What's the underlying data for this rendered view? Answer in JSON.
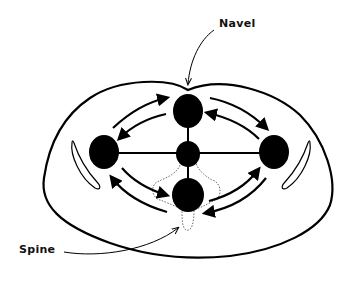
{
  "diagram": {
    "type": "anatomical cross-section",
    "labels": {
      "navel": "Navel",
      "spine": "Spine"
    },
    "nodes": [
      {
        "id": "top",
        "position": "front (navel side)"
      },
      {
        "id": "center",
        "position": "center"
      },
      {
        "id": "left",
        "position": "left side"
      },
      {
        "id": "right",
        "position": "right side"
      },
      {
        "id": "bottom",
        "position": "back (spine side)"
      }
    ],
    "colors": {
      "ink": "#000000",
      "background": "#ffffff",
      "dotted_outline": "#555555"
    }
  }
}
